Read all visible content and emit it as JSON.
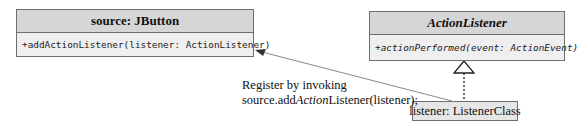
{
  "classes": {
    "source": {
      "name": "source: JButton",
      "method": "+addActionListener(listener: ActionListener)"
    },
    "interface": {
      "name": "ActionListener",
      "method": "+actionPerformed(event: ActionEvent)"
    },
    "listener": {
      "name": "listener: ListenerClass"
    }
  },
  "note": {
    "line1": "Register by invoking",
    "line2_prefix": "source.add",
    "line2_italic": "Action",
    "line2_suffix": "Listener(listener);"
  },
  "colors": {
    "header_fill": "#d6d6d6",
    "body_fill": "#efefef",
    "border": "#6e6e6e",
    "line": "#888888"
  }
}
